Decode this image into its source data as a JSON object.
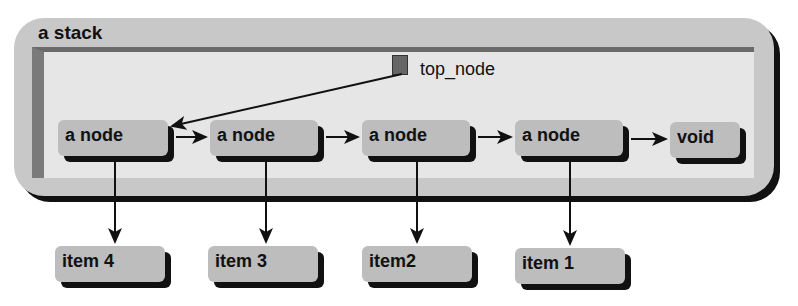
{
  "stack": {
    "title": "a stack"
  },
  "top_pointer": {
    "label": "top_node",
    "icon": "down-arrow-marker-icon"
  },
  "nodes": [
    {
      "label": "a node"
    },
    {
      "label": "a node"
    },
    {
      "label": "a node"
    },
    {
      "label": "a node"
    },
    {
      "label": "void"
    }
  ],
  "items": [
    {
      "label": "item 4"
    },
    {
      "label": "item 3"
    },
    {
      "label": "item2"
    },
    {
      "label": "item 1"
    }
  ],
  "colors": {
    "container": "#c8c8c8",
    "panel": "#e6e6e6",
    "box": "#bdbdbd",
    "shadow": "#111111",
    "panel_border": "#6a6a6a"
  }
}
